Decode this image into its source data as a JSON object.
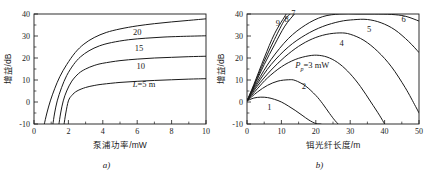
{
  "figure": {
    "panel_a_caption": "a)",
    "panel_b_caption": "b)"
  },
  "chart_data": [
    {
      "id": "panel-a",
      "type": "line",
      "title": "",
      "xlabel": "泵浦功率/mW",
      "ylabel": "增益/dB",
      "xlim": [
        0,
        10
      ],
      "ylim": [
        -10,
        40
      ],
      "xticks": [
        0,
        2,
        4,
        6,
        8,
        10
      ],
      "xticklabels": [
        "0",
        "2",
        "4",
        "6",
        "8",
        "10"
      ],
      "yticks": [
        -10,
        0,
        10,
        20,
        30,
        40
      ],
      "yticklabels": [
        "-10",
        "0",
        "10",
        "20",
        "30",
        "40"
      ],
      "grid": false,
      "legend": "inline-curve-labels",
      "annotations": [
        {
          "text": "20",
          "x": 6.0,
          "y": 30.5
        },
        {
          "text": "15",
          "x": 6.1,
          "y": 23.0
        },
        {
          "text": "10",
          "x": 6.2,
          "y": 15.0
        },
        {
          "text": "L=5 m",
          "x": 6.4,
          "y": 7.0
        }
      ],
      "series": [
        {
          "name": "L = 5 m",
          "label": "L=5 m",
          "x": [
            1.75,
            1.85,
            2.0,
            2.2,
            2.5,
            3.0,
            3.5,
            4.0,
            5.0,
            6.0,
            7.0,
            8.0,
            9.0,
            10.0
          ],
          "y": [
            -10.0,
            -5.0,
            0.5,
            3.0,
            5.0,
            6.6,
            7.5,
            8.1,
            8.9,
            9.4,
            9.8,
            10.1,
            10.4,
            10.6
          ]
        },
        {
          "name": "L = 10 m",
          "label": "10",
          "x": [
            1.45,
            1.55,
            1.7,
            1.9,
            2.2,
            2.6,
            3.0,
            3.5,
            4.0,
            5.0,
            6.0,
            7.0,
            8.0,
            9.0,
            10.0
          ],
          "y": [
            -10.0,
            -5.0,
            0.5,
            5.0,
            9.5,
            13.0,
            15.0,
            16.6,
            17.6,
            18.8,
            19.5,
            20.0,
            20.3,
            20.6,
            20.8
          ]
        },
        {
          "name": "L = 15 m",
          "label": "15",
          "x": [
            1.1,
            1.2,
            1.35,
            1.6,
            1.9,
            2.3,
            2.7,
            3.2,
            3.8,
            4.5,
            5.5,
            6.5,
            7.5,
            8.5,
            10.0
          ],
          "y": [
            -10.0,
            -5.0,
            0.5,
            6.5,
            12.0,
            17.0,
            20.5,
            23.3,
            25.5,
            27.0,
            28.3,
            29.0,
            29.5,
            29.8,
            30.1
          ]
        },
        {
          "name": "L = 20 m",
          "label": "20",
          "x": [
            0.6,
            0.75,
            0.95,
            1.2,
            1.5,
            1.9,
            2.4,
            2.9,
            3.5,
            4.2,
            5.0,
            6.0,
            7.0,
            8.0,
            9.0,
            10.0
          ],
          "y": [
            -10.0,
            -5.0,
            0.5,
            6.0,
            11.5,
            17.0,
            22.5,
            26.3,
            29.3,
            31.6,
            33.2,
            34.6,
            35.6,
            36.4,
            37.1,
            37.8
          ]
        }
      ]
    },
    {
      "id": "panel-b",
      "type": "line",
      "title": "",
      "xlabel": "铒光纤长度/m",
      "ylabel": "增益/dB",
      "xlim": [
        0,
        50
      ],
      "ylim": [
        -10,
        40
      ],
      "xticks": [
        0,
        10,
        20,
        30,
        40,
        50
      ],
      "xticklabels": [
        "0",
        "10",
        "20",
        "30",
        "40",
        "50"
      ],
      "yticks": [
        -10,
        0,
        10,
        20,
        30,
        40
      ],
      "yticklabels": [
        "-10",
        "0",
        "10",
        "20",
        "30",
        "40"
      ],
      "grid": false,
      "legend": "inline-curve-labels",
      "annotations": [
        {
          "text": "1",
          "x": 6.5,
          "y": -3.5
        },
        {
          "text": "2",
          "x": 16.5,
          "y": 6.0
        },
        {
          "text": "Pp=3 mW",
          "x": 19.0,
          "y": 15.5
        },
        {
          "text": "4",
          "x": 27.5,
          "y": 25.5
        },
        {
          "text": "5",
          "x": 35.5,
          "y": 32.0
        },
        {
          "text": "6",
          "x": 45.5,
          "y": 36.5
        },
        {
          "text": "7",
          "x": 13.5,
          "y": 39.0
        },
        {
          "text": "8",
          "x": 11.5,
          "y": 36.5
        },
        {
          "text": "9",
          "x": 9.0,
          "y": 34.5
        }
      ],
      "series": [
        {
          "name": "Pp = 1 mW",
          "label": "1",
          "x": [
            0,
            2,
            4,
            6,
            8,
            10,
            12,
            14,
            16,
            18,
            20,
            21.5
          ],
          "y": [
            0.5,
            1.8,
            2.2,
            2.0,
            1.2,
            0.0,
            -1.8,
            -3.8,
            -6.0,
            -8.2,
            -9.8,
            -10.0
          ]
        },
        {
          "name": "Pp = 2 mW",
          "label": "2",
          "x": [
            0,
            3,
            6,
            9,
            12,
            14,
            17,
            20,
            22,
            24,
            25.5,
            26.5
          ],
          "y": [
            0.5,
            4.5,
            7.6,
            9.5,
            10.1,
            9.8,
            7.3,
            3.0,
            -0.8,
            -5.2,
            -8.3,
            -10.0
          ]
        },
        {
          "name": "Pp = 3 mW",
          "label": "Pp=3 mW",
          "x": [
            0,
            3,
            6,
            10,
            14,
            18,
            21,
            24,
            27,
            30,
            33,
            36,
            38.5,
            40
          ],
          "y": [
            0.5,
            6.0,
            11.0,
            16.0,
            19.3,
            21.0,
            21.2,
            20.0,
            17.2,
            12.8,
            7.0,
            0.0,
            -6.0,
            -10.0
          ]
        },
        {
          "name": "Pp = 4 mW",
          "label": "4",
          "x": [
            0,
            3,
            7,
            11,
            15,
            19,
            23,
            27,
            30,
            34,
            38,
            42,
            46,
            49,
            50
          ],
          "y": [
            0.5,
            7.2,
            14.5,
            20.5,
            25.3,
            28.7,
            30.7,
            31.4,
            30.8,
            28.0,
            23.0,
            16.0,
            6.5,
            -2.0,
            -5.0
          ]
        },
        {
          "name": "Pp = 5 mW",
          "label": "5",
          "x": [
            0,
            3,
            7,
            12,
            17,
            22,
            27,
            31,
            35,
            39,
            43,
            47,
            50
          ],
          "y": [
            0.5,
            8.2,
            17.0,
            25.0,
            30.5,
            34.3,
            36.6,
            37.4,
            37.5,
            36.0,
            32.8,
            27.5,
            22.5
          ]
        },
        {
          "name": "Pp = 6 mW",
          "label": "6",
          "x": [
            0,
            3,
            7,
            12,
            17,
            22,
            27,
            32,
            37,
            42,
            46,
            50
          ],
          "y": [
            0.5,
            9.2,
            19.3,
            28.8,
            35.0,
            38.8,
            40.0,
            40.0,
            40.0,
            39.8,
            39.0,
            36.8
          ]
        },
        {
          "name": "Pp = 7 mW",
          "label": "7",
          "x": [
            0,
            2,
            5,
            8,
            11,
            13.8
          ],
          "y": [
            0.5,
            7.0,
            17.0,
            26.0,
            34.5,
            40.0
          ]
        },
        {
          "name": "Pp = 8 mW",
          "label": "8",
          "x": [
            0,
            2,
            5,
            8,
            11,
            12.6
          ],
          "y": [
            0.5,
            7.5,
            18.5,
            28.5,
            37.5,
            40.0
          ]
        },
        {
          "name": "Pp = 9 mW",
          "label": "9",
          "x": [
            0,
            2,
            5,
            8,
            11.4
          ],
          "y": [
            0.5,
            8.0,
            20.0,
            31.0,
            40.0
          ]
        }
      ]
    }
  ]
}
